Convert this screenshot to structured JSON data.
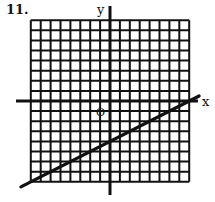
{
  "problem_number": "11.",
  "chart_data": {
    "type": "line",
    "title": "",
    "xlabel": "x",
    "ylabel": "y",
    "origin_label": "O",
    "grid": true,
    "xlim": [
      -8,
      8
    ],
    "ylim": [
      -8,
      8
    ],
    "series": [
      {
        "name": "line",
        "equation": "y = x/2 - 4",
        "x": [
          -9,
          0,
          8,
          9
        ],
        "y": [
          -8.5,
          -4,
          0,
          0.5
        ]
      }
    ]
  },
  "colors": {
    "ink": "#111111",
    "background": "#ffffff"
  }
}
